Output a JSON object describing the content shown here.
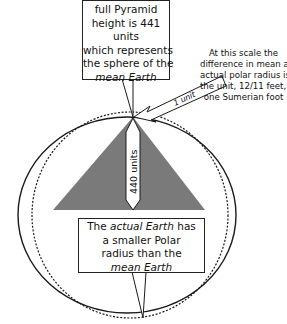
{
  "diagram": {
    "top_callout": {
      "lines": [
        "full Pyramid",
        "height is 441",
        "units",
        "which represents",
        "the sphere of the"
      ],
      "italic_line": "mean Earth"
    },
    "side_note": {
      "lines": [
        "At this scale the",
        "difference in mean and",
        "actual polar radius is",
        "the unit, 12/11 feet, or",
        "one Sumerian foot"
      ]
    },
    "unit_arrow_label": "1 unit",
    "height_arrow_label": "440 units",
    "bottom_callout": {
      "line1_prefix": "The ",
      "line1_italic": "actual Earth",
      "line1_suffix": " has",
      "lines": [
        "a smaller Polar",
        "radius than the"
      ],
      "italic_line": "mean Earth"
    },
    "shapes": {
      "solid_ellipse": "actual Earth",
      "dashed_ellipse": "mean Earth",
      "triangle": "Pyramid"
    },
    "colors": {
      "pyramid_fill": "#7a7a7a",
      "stroke": "#1a1a1a",
      "background": "#ffffff"
    }
  }
}
